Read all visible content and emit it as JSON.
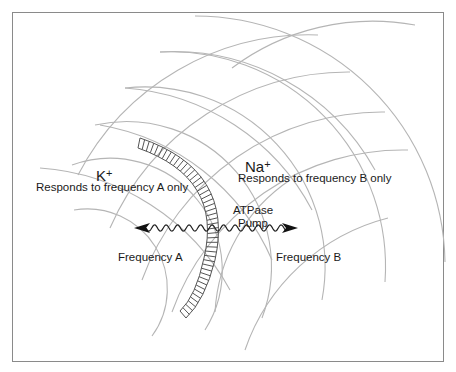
{
  "diagram": {
    "left_region": {
      "ion": "K",
      "ion_charge": "+",
      "description": "Responds to frequency A only",
      "frequency_label": "Frequency A"
    },
    "right_region": {
      "ion": "Na",
      "ion_charge": "+",
      "description": "Responds to frequency B only",
      "frequency_label": "Frequency B"
    },
    "pump": {
      "line1": "ATPase",
      "line2": "Pump"
    },
    "colors": {
      "arc_lines": "#b0b0b0",
      "membrane": "#555555",
      "wave": "#222222",
      "frame": "#8a8a8a",
      "text": "#1a1a1a"
    }
  }
}
